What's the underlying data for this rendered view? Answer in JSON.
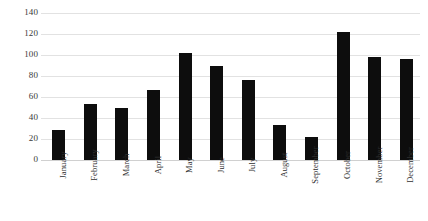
{
  "chart_data": {
    "type": "bar",
    "title": "",
    "subtitle": "",
    "xlabel": "",
    "ylabel": "",
    "categories": [
      "January",
      "February",
      "March",
      "April",
      "May",
      "June",
      "July",
      "August",
      "September",
      "October",
      "November",
      "December"
    ],
    "values": [
      29,
      53,
      50,
      67,
      102,
      90,
      76,
      33,
      22,
      122,
      98,
      96
    ],
    "series": [
      {
        "name": "",
        "values": [
          29,
          53,
          50,
          67,
          102,
          90,
          76,
          33,
          22,
          122,
          98,
          96
        ]
      }
    ],
    "ylim": [
      0,
      140
    ],
    "ytick_values": [
      0,
      20,
      40,
      60,
      80,
      100,
      120,
      140
    ],
    "ytick_labels": [
      "0",
      "20",
      "40",
      "60",
      "80",
      "100",
      "120",
      "140"
    ],
    "grid": true,
    "grid_axis": "y",
    "legend": false,
    "legend_position": "none",
    "annotations": [],
    "bar_color": "#0d0d0d",
    "gridline_color": "#e2e2e2",
    "background_color": "#ffffff",
    "xtick_label_rotation": 90
  }
}
